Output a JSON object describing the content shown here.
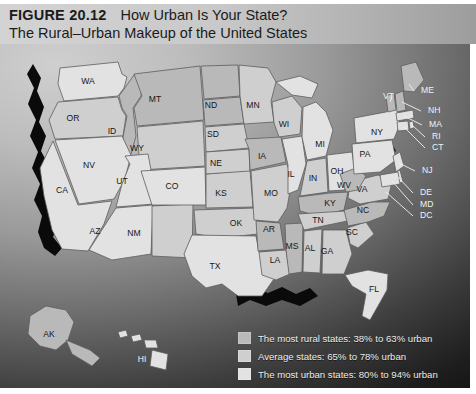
{
  "figure": {
    "label": "FIGURE 20.12",
    "title": "How Urban Is Your State?",
    "subtitle": "The Rural–Urban Makeup of the United States"
  },
  "legend": {
    "items": [
      {
        "label": "The most rural states: 38% to 63% urban",
        "color": "#b9b9b9",
        "bin": "rural"
      },
      {
        "label": "Average states: 65% to 78% urban",
        "color": "#cfcfcf",
        "bin": "average"
      },
      {
        "label": "The most urban states: 80% to 94% urban",
        "color": "#e2e2e2",
        "bin": "urban"
      }
    ]
  },
  "map": {
    "states": [
      {
        "code": "WA",
        "x": 88,
        "y": 38,
        "tone": 3
      },
      {
        "code": "OR",
        "x": 73,
        "y": 75,
        "tone": 2
      },
      {
        "code": "ID",
        "x": 112,
        "y": 88,
        "tone": 1
      },
      {
        "code": "MT",
        "x": 155,
        "y": 56,
        "tone": 1
      },
      {
        "code": "WY",
        "x": 137,
        "y": 105,
        "tone": 2
      },
      {
        "code": "NV",
        "x": 89,
        "y": 122,
        "tone": 3
      },
      {
        "code": "UT",
        "x": 122,
        "y": 138,
        "tone": 3
      },
      {
        "code": "CA",
        "x": 62,
        "y": 147,
        "tone": 3
      },
      {
        "code": "AZ",
        "x": 95,
        "y": 188,
        "tone": 3
      },
      {
        "code": "NM",
        "x": 134,
        "y": 190,
        "tone": 2
      },
      {
        "code": "CO",
        "x": 172,
        "y": 143,
        "tone": 3
      },
      {
        "code": "ND",
        "x": 211,
        "y": 62,
        "tone": 1
      },
      {
        "code": "SD",
        "x": 213,
        "y": 91,
        "tone": 1
      },
      {
        "code": "NE",
        "x": 216,
        "y": 120,
        "tone": 2
      },
      {
        "code": "KS",
        "x": 221,
        "y": 150,
        "tone": 2
      },
      {
        "code": "OK",
        "x": 236,
        "y": 180,
        "tone": 2
      },
      {
        "code": "TX",
        "x": 215,
        "y": 223,
        "tone": 3
      },
      {
        "code": "MN",
        "x": 253,
        "y": 62,
        "tone": 2
      },
      {
        "code": "IA",
        "x": 262,
        "y": 113,
        "tone": 1
      },
      {
        "code": "MO",
        "x": 271,
        "y": 150,
        "tone": 2
      },
      {
        "code": "AR",
        "x": 269,
        "y": 186,
        "tone": 1
      },
      {
        "code": "LA",
        "x": 275,
        "y": 217,
        "tone": 2
      },
      {
        "code": "MS",
        "x": 292,
        "y": 203,
        "tone": 1
      },
      {
        "code": "WI",
        "x": 284,
        "y": 81,
        "tone": 2
      },
      {
        "code": "IL",
        "x": 291,
        "y": 131,
        "tone": 3
      },
      {
        "code": "MI",
        "x": 320,
        "y": 101,
        "tone": 3
      },
      {
        "code": "IN",
        "x": 313,
        "y": 135,
        "tone": 2
      },
      {
        "code": "OH",
        "x": 337,
        "y": 128,
        "tone": 3
      },
      {
        "code": "KY",
        "x": 330,
        "y": 160,
        "tone": 1
      },
      {
        "code": "TN",
        "x": 318,
        "y": 177,
        "tone": 2
      },
      {
        "code": "AL",
        "x": 310,
        "y": 205,
        "tone": 2
      },
      {
        "code": "GA",
        "x": 327,
        "y": 208,
        "tone": 2
      },
      {
        "code": "FL",
        "x": 374,
        "y": 246,
        "tone": 3
      },
      {
        "code": "SC",
        "x": 352,
        "y": 189,
        "tone": 2
      },
      {
        "code": "NC",
        "x": 363,
        "y": 167,
        "tone": 1
      },
      {
        "code": "VA",
        "x": 362,
        "y": 146,
        "tone": 2
      },
      {
        "code": "WV",
        "x": 344,
        "y": 142,
        "tone": 1
      },
      {
        "code": "PA",
        "x": 365,
        "y": 111,
        "tone": 3
      },
      {
        "code": "NY",
        "x": 377,
        "y": 89,
        "tone": 3
      },
      {
        "code": "AK",
        "x": 49,
        "y": 291,
        "tone": 1
      },
      {
        "code": "HI",
        "x": 142,
        "y": 316,
        "tone": 3,
        "white": true
      }
    ],
    "callouts": [
      {
        "code": "VT",
        "x": 383,
        "y": 53,
        "tone": 1
      },
      {
        "code": "ME",
        "x": 421,
        "y": 47,
        "tone": 1
      },
      {
        "code": "NH",
        "x": 428,
        "y": 67,
        "tone": 1
      },
      {
        "code": "MA",
        "x": 429,
        "y": 81,
        "tone": 3
      },
      {
        "code": "RI",
        "x": 432,
        "y": 93,
        "tone": 3
      },
      {
        "code": "CT",
        "x": 432,
        "y": 104,
        "tone": 3
      },
      {
        "code": "NJ",
        "x": 422,
        "y": 127,
        "tone": 3
      },
      {
        "code": "DE",
        "x": 420,
        "y": 149,
        "tone": 3
      },
      {
        "code": "MD",
        "x": 420,
        "y": 161,
        "tone": 3
      },
      {
        "code": "DC",
        "x": 420,
        "y": 172,
        "tone": 3
      }
    ]
  }
}
